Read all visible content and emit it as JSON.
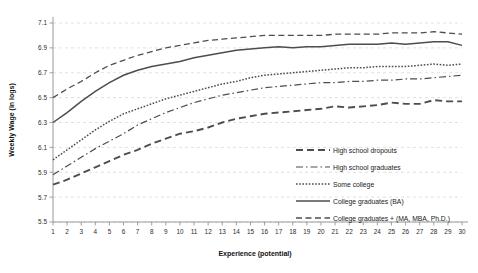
{
  "chart_data": {
    "type": "line",
    "title": "",
    "xlabel": "Experience (potential)",
    "ylabel": "Weekly Wage (in logs)",
    "xlim": [
      1,
      30
    ],
    "ylim": [
      5.5,
      7.1
    ],
    "yticks": [
      "5.5",
      "5.7",
      "5.9",
      "6.1",
      "6.3",
      "6.5",
      "6.7",
      "6.9",
      "7.1"
    ],
    "ytick_values": [
      5.5,
      5.7,
      5.9,
      6.1,
      6.3,
      6.5,
      6.7,
      6.9,
      7.1
    ],
    "grid": true,
    "legend_position": "inside-lower-right",
    "x": [
      1,
      2,
      3,
      4,
      5,
      6,
      7,
      8,
      9,
      10,
      11,
      12,
      13,
      14,
      15,
      16,
      17,
      18,
      19,
      20,
      21,
      22,
      23,
      24,
      25,
      26,
      27,
      28,
      29,
      30
    ],
    "xticks": [
      "1",
      "2",
      "3",
      "4",
      "5",
      "6",
      "7",
      "8",
      "9",
      "10",
      "11",
      "12",
      "13",
      "14",
      "15",
      "16",
      "17",
      "18",
      "19",
      "20",
      "21",
      "22",
      "23",
      "24",
      "25",
      "26",
      "27",
      "28",
      "29",
      "30"
    ],
    "series": [
      {
        "name": "High school dropouts",
        "style": "dashed",
        "dash": "7 4",
        "width": 1.9,
        "values": [
          5.8,
          5.84,
          5.89,
          5.94,
          5.99,
          6.04,
          6.08,
          6.13,
          6.17,
          6.21,
          6.23,
          6.26,
          6.3,
          6.33,
          6.35,
          6.37,
          6.38,
          6.39,
          6.4,
          6.41,
          6.43,
          6.42,
          6.43,
          6.44,
          6.46,
          6.45,
          6.45,
          6.48,
          6.47,
          6.47
        ]
      },
      {
        "name": "High school graduates",
        "style": "dash-dot",
        "dash": "7 3 1.5 3",
        "width": 1.2,
        "values": [
          5.88,
          5.95,
          6.02,
          6.09,
          6.15,
          6.21,
          6.28,
          6.33,
          6.38,
          6.42,
          6.46,
          6.49,
          6.52,
          6.54,
          6.56,
          6.58,
          6.59,
          6.6,
          6.61,
          6.62,
          6.62,
          6.63,
          6.63,
          6.64,
          6.64,
          6.65,
          6.65,
          6.66,
          6.67,
          6.68
        ]
      },
      {
        "name": "Some college",
        "style": "dotted",
        "dash": "1.6 1.6",
        "width": 1.5,
        "values": [
          6.0,
          6.08,
          6.16,
          6.24,
          6.31,
          6.37,
          6.41,
          6.45,
          6.49,
          6.52,
          6.55,
          6.58,
          6.61,
          6.63,
          6.66,
          6.68,
          6.69,
          6.7,
          6.71,
          6.72,
          6.73,
          6.74,
          6.74,
          6.75,
          6.75,
          6.75,
          6.76,
          6.77,
          6.76,
          6.77
        ]
      },
      {
        "name": "College graduates (BA)",
        "style": "solid",
        "dash": "none",
        "width": 1.5,
        "values": [
          6.3,
          6.38,
          6.47,
          6.55,
          6.62,
          6.68,
          6.72,
          6.75,
          6.77,
          6.79,
          6.82,
          6.84,
          6.86,
          6.88,
          6.89,
          6.9,
          6.91,
          6.9,
          6.91,
          6.91,
          6.92,
          6.93,
          6.93,
          6.93,
          6.94,
          6.93,
          6.94,
          6.95,
          6.95,
          6.92
        ]
      },
      {
        "name": "College graduates + (MA, MBA, Ph.D.)",
        "style": "dashed",
        "dash": "6 3.5",
        "width": 1.3,
        "values": [
          6.5,
          6.57,
          6.63,
          6.7,
          6.76,
          6.8,
          6.84,
          6.87,
          6.9,
          6.92,
          6.94,
          6.96,
          6.97,
          6.98,
          6.99,
          7.0,
          7.0,
          7.0,
          7.0,
          7.0,
          7.01,
          7.01,
          7.01,
          7.01,
          7.02,
          7.02,
          7.02,
          7.03,
          7.02,
          7.01
        ]
      }
    ],
    "colors": {
      "line": "#4d4d4d",
      "grid": "#d8d8d8",
      "axis": "#9a9a9a",
      "text": "#1a1a1a",
      "background": "#ffffff"
    }
  },
  "legend": {
    "entries": [
      {
        "label": "High school dropouts"
      },
      {
        "label": "High school graduates"
      },
      {
        "label": "Some college"
      },
      {
        "label": "College graduates (BA)"
      },
      {
        "label": "College graduates + (MA, MBA, Ph.D.)"
      }
    ]
  }
}
